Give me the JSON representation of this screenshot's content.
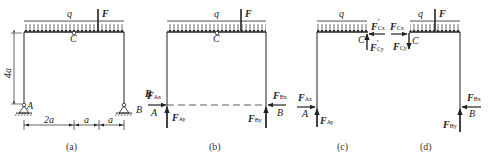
{
  "figure": {
    "panels": [
      {
        "id": "a",
        "caption": "(a)",
        "labels": {
          "load": "q",
          "force": "F",
          "hinge": "C",
          "support_left": "A",
          "support_right": "B",
          "height": "4a"
        },
        "dimensions": [
          "2a",
          "a",
          "a"
        ]
      },
      {
        "id": "b",
        "caption": "(b)",
        "labels": {
          "load": "q",
          "force": "F",
          "hinge": "C",
          "left": "A",
          "right": "B",
          "FAx": "F",
          "FAx_sub": "Ax",
          "FAy": "F",
          "FAy_sub": "Ay",
          "FBx": "F",
          "FBx_sub": "Bx",
          "FBy": "F",
          "FBy_sub": "By"
        }
      },
      {
        "id": "c",
        "caption": "(c)",
        "labels": {
          "load": "q",
          "hinge": "C",
          "left": "A",
          "FCx": "F",
          "FCx_sub": "Cx",
          "FCx_prime": "′",
          "FCy": "F",
          "FCy_sub": "Cy",
          "FCy_prime": "′",
          "FAx": "F",
          "FAx_sub": "Ax",
          "FAy": "F",
          "FAy_sub": "Ay"
        }
      },
      {
        "id": "d",
        "caption": "(d)",
        "labels": {
          "load": "q",
          "force": "F",
          "hinge": "C",
          "right": "B",
          "FCx": "F",
          "FCx_sub": "Cx",
          "FCy": "F",
          "FCy_sub": "Cy",
          "FBx": "F",
          "FBx_sub": "Bx",
          "FBy": "F",
          "FBy_sub": "By"
        }
      }
    ],
    "stray_label": "B"
  }
}
